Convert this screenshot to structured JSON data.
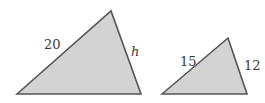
{
  "diagram": {
    "title": "",
    "colors": {
      "fill": "#d3d3d3",
      "stroke": "#555555",
      "text": "#3a3a3a"
    },
    "triangles": [
      {
        "id": "large-triangle",
        "vertices": [
          [
            17,
            94
          ],
          [
            111,
            11
          ],
          [
            141,
            94
          ]
        ],
        "labels": {
          "left_side": "20",
          "right_side": "h"
        }
      },
      {
        "id": "small-triangle",
        "vertices": [
          [
            162,
            94
          ],
          [
            228,
            38
          ],
          [
            247,
            94
          ]
        ],
        "labels": {
          "left_side": "15",
          "right_side": "12"
        }
      }
    ]
  }
}
